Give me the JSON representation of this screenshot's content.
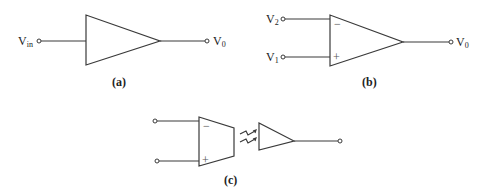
{
  "diagram": {
    "panel_a": {
      "caption": "(a)",
      "input_label": "V",
      "input_sub": "in",
      "output_label": "V",
      "output_sub": "0",
      "component": "amplifier-triangle"
    },
    "panel_b": {
      "caption": "(b)",
      "input_top_label": "V",
      "input_top_sub": "2",
      "input_bottom_label": "V",
      "input_bottom_sub": "1",
      "minus_sign": "−",
      "plus_sign": "+",
      "output_label": "V",
      "output_sub": "0",
      "component": "op-amp"
    },
    "panel_c": {
      "caption": "(c)",
      "minus_sign": "−",
      "plus_sign": "+",
      "component": "isolation-amplifier",
      "coupling": "optical/wireless-link"
    }
  }
}
